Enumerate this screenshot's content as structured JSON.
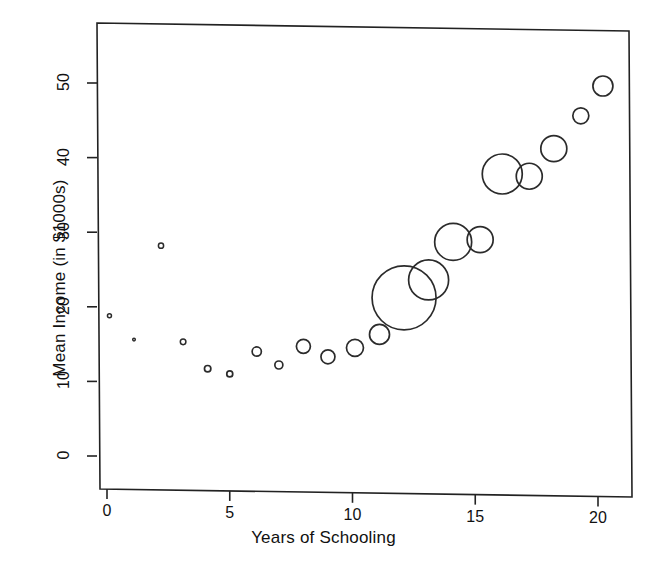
{
  "chart_data": {
    "type": "scatter",
    "title": "",
    "xlabel": "Years of Schooling",
    "ylabel": "Mean Income (in $1000s)",
    "xlim": [
      -0.6,
      21.0
    ],
    "ylim": [
      -2.0,
      57.0
    ],
    "xticks": [
      0,
      5,
      10,
      15,
      20
    ],
    "yticks": [
      0,
      10,
      20,
      30,
      40,
      50
    ],
    "xtick_labels": [
      "0",
      "5",
      "10",
      "15",
      "20"
    ],
    "ytick_labels": [
      "0",
      "10",
      "20",
      "30",
      "40",
      "50"
    ],
    "grid": false,
    "legend": "none",
    "marker": "open-circle",
    "size_encoding": "bubble area proportional to group sample size",
    "points": [
      {
        "x": 0.1,
        "y": 18.8,
        "r": 2.0
      },
      {
        "x": 1.1,
        "y": 15.6,
        "r": 1.3
      },
      {
        "x": 2.2,
        "y": 28.2,
        "r": 2.6
      },
      {
        "x": 3.1,
        "y": 15.3,
        "r": 2.8
      },
      {
        "x": 4.1,
        "y": 11.7,
        "r": 3.2
      },
      {
        "x": 5.0,
        "y": 11.0,
        "r": 3.0
      },
      {
        "x": 6.1,
        "y": 14.0,
        "r": 4.6
      },
      {
        "x": 7.0,
        "y": 12.2,
        "r": 4.0
      },
      {
        "x": 8.0,
        "y": 14.7,
        "r": 7.0
      },
      {
        "x": 9.0,
        "y": 13.3,
        "r": 7.0
      },
      {
        "x": 10.1,
        "y": 14.5,
        "r": 8.5
      },
      {
        "x": 11.1,
        "y": 16.3,
        "r": 10.0
      },
      {
        "x": 12.1,
        "y": 21.2,
        "r": 32.0
      },
      {
        "x": 13.1,
        "y": 23.6,
        "r": 20.0
      },
      {
        "x": 14.1,
        "y": 28.7,
        "r": 18.5
      },
      {
        "x": 15.2,
        "y": 29.0,
        "r": 13.0
      },
      {
        "x": 16.1,
        "y": 37.8,
        "r": 20.0
      },
      {
        "x": 17.2,
        "y": 37.5,
        "r": 13.0
      },
      {
        "x": 18.2,
        "y": 41.2,
        "r": 13.0
      },
      {
        "x": 19.3,
        "y": 45.6,
        "r": 8.0
      },
      {
        "x": 20.2,
        "y": 49.6,
        "r": 10.0
      }
    ],
    "colors": {
      "marker_stroke": "#2b2b2b",
      "marker_fill": "none",
      "axis": "#222222",
      "background": "#ffffff"
    }
  },
  "axes": {
    "x_title": "Years of Schooling",
    "y_title": "Mean Income (in $1000s)"
  }
}
